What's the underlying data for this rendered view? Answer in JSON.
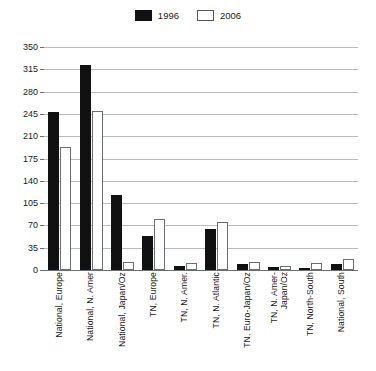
{
  "legend": {
    "position": "top-center",
    "entries": [
      {
        "label": "1996",
        "swatch": "filled-black",
        "color": "#111111"
      },
      {
        "label": "2006",
        "swatch": "hollow-white",
        "color": "#ffffff"
      }
    ]
  },
  "chart_data": {
    "type": "bar",
    "title": "",
    "subtitle": "",
    "xlabel": "",
    "ylabel": "",
    "ylim": [
      0,
      350
    ],
    "yticks": [
      0,
      35,
      70,
      105,
      140,
      175,
      210,
      245,
      280,
      315,
      350
    ],
    "grid": true,
    "legend_position": "top-center",
    "categories": [
      "National, Europe",
      "National, N. Amer",
      "National, Japan/Oz",
      "TN, Europe",
      "TN, N. Amer.",
      "TN, N. Atlantic",
      "TN, Euro-Japan/Oz",
      "TN, N. Amer-\nJapan/Oz",
      "TN, North-South",
      "National, South"
    ],
    "series": [
      {
        "name": "1996",
        "color": "#111111",
        "values": [
          248,
          322,
          118,
          54,
          6,
          65,
          9,
          4,
          2,
          9
        ]
      },
      {
        "name": "2006",
        "color": "#ffffff",
        "values": [
          193,
          250,
          13,
          80,
          11,
          76,
          13,
          6,
          11,
          18
        ]
      }
    ]
  }
}
